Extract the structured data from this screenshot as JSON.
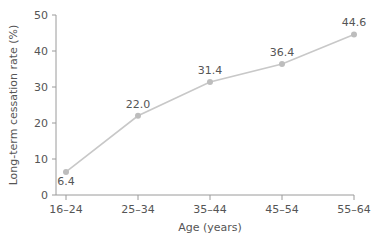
{
  "chart_data": {
    "type": "line",
    "title": "",
    "xlabel": "Age (years)",
    "ylabel": "Long-term cessation rate (%)",
    "categories": [
      "16–24",
      "25–34",
      "35–44",
      "45–54",
      "55–64"
    ],
    "series": [
      {
        "name": "Long-term cessation rate",
        "values": [
          6.4,
          22.0,
          31.4,
          36.4,
          44.6
        ],
        "labels": [
          "6.4",
          "22.0",
          "31.4",
          "36.4",
          "44.6"
        ]
      }
    ],
    "ylim": [
      0,
      50
    ],
    "yticks": [
      0,
      10,
      20,
      30,
      40,
      50
    ],
    "grid": false,
    "legend": "none",
    "colors": {
      "line": "#c8c8c8",
      "marker": "#bdbdbd",
      "axis": "#9a9a9a",
      "text": "#555555"
    }
  }
}
